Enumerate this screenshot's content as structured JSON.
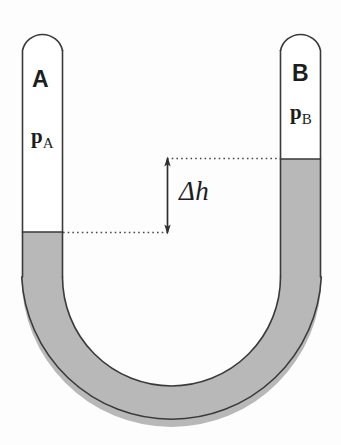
{
  "figure": {
    "name": "u-tube-manometer-diagram",
    "type": "physics-schematic",
    "background_color": "#fdfdfd"
  },
  "colors": {
    "fluid": "#b8b8b8",
    "outline": "#3a3a3a",
    "tube_interior": "#ffffff",
    "annotation": "#3a3a3a",
    "text": "#1d1d1d"
  },
  "labels": {
    "left_tube_letter": "A",
    "left_tube_pressure": "p",
    "left_tube_pressure_subscript": "A",
    "right_tube_letter": "B",
    "right_tube_pressure": "p",
    "right_tube_pressure_subscript": "B",
    "height_difference": "Δh"
  },
  "geometry": {
    "left_tube": {
      "outer_left_x": 22,
      "outer_right_x": 63,
      "cap_top_y": 30,
      "fluid_surface_y": 232
    },
    "right_tube": {
      "outer_left_x": 280,
      "outer_right_x": 321,
      "cap_top_y": 30,
      "fluid_surface_y": 159
    },
    "bend": {
      "center_x": 171.5,
      "center_y": 277,
      "outer_radius": 150,
      "inner_radius": 109,
      "bottom_y": 427
    },
    "annotation": {
      "upper_dotted_line_y": 158,
      "upper_dotted_line_x_start": 167,
      "upper_dotted_line_x_end": 282,
      "lower_dotted_line_y": 232,
      "lower_dotted_line_x_start": 63,
      "lower_dotted_line_x_end": 167,
      "arrow_x": 167,
      "arrow_top_y": 158,
      "arrow_bottom_y": 232,
      "delta_h_pixels": 74
    }
  }
}
